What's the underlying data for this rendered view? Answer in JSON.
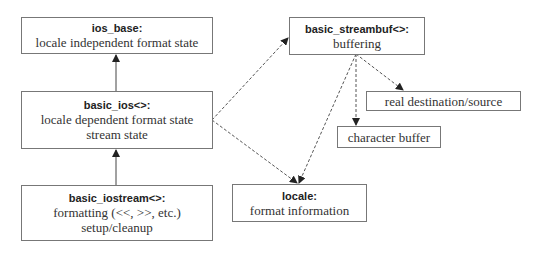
{
  "diagram": {
    "nodes": {
      "ios_base": {
        "title": "ios_base:",
        "lines": [
          "locale independent format state"
        ]
      },
      "basic_ios": {
        "title": "basic_ios<>:",
        "lines": [
          "locale dependent format state",
          "stream state"
        ]
      },
      "basic_iostream": {
        "title": "basic_iostream<>:",
        "lines": [
          "formatting (<<, >>, etc.)",
          "setup/cleanup"
        ]
      },
      "basic_streambuf": {
        "title": "basic_streambuf<>:",
        "lines": [
          "buffering"
        ]
      },
      "real_destination": {
        "lines": [
          "real destination/source"
        ]
      },
      "character_buffer": {
        "lines": [
          "character buffer"
        ]
      },
      "locale": {
        "title": "locale:",
        "lines": [
          "format information"
        ]
      }
    },
    "edges": [
      {
        "from": "basic_ios",
        "to": "ios_base",
        "style": "solid"
      },
      {
        "from": "basic_iostream",
        "to": "basic_ios",
        "style": "solid"
      },
      {
        "from": "basic_ios",
        "to": "basic_streambuf",
        "style": "dashed"
      },
      {
        "from": "basic_ios",
        "to": "locale",
        "style": "dashed"
      },
      {
        "from": "basic_streambuf",
        "to": "locale",
        "style": "dashed"
      },
      {
        "from": "basic_streambuf",
        "to": "character_buffer",
        "style": "dashed"
      },
      {
        "from": "basic_streambuf",
        "to": "real_destination",
        "style": "dashed"
      }
    ],
    "colors": {
      "line": "#444444",
      "border": "#777777",
      "text": "#333333"
    }
  }
}
